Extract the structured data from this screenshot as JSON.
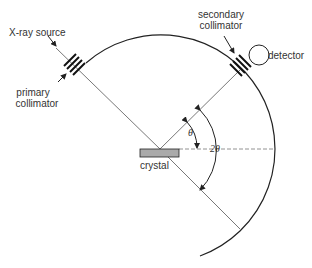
{
  "diagram": {
    "labels": {
      "source": "X-ray source",
      "primary_collimator_line1": "primary",
      "primary_collimator_line2": "collimator",
      "secondary_collimator_line1": "secondary",
      "secondary_collimator_line2": "collimator",
      "detector": "detector",
      "crystal": "crystal",
      "theta": "θ",
      "two_theta": "2θ"
    },
    "colors": {
      "line": "#222222",
      "crystal_fill": "#aaaaaa",
      "beam": "#444444"
    },
    "angles": {
      "theta_deg": 35,
      "two_theta_deg": 70
    }
  }
}
